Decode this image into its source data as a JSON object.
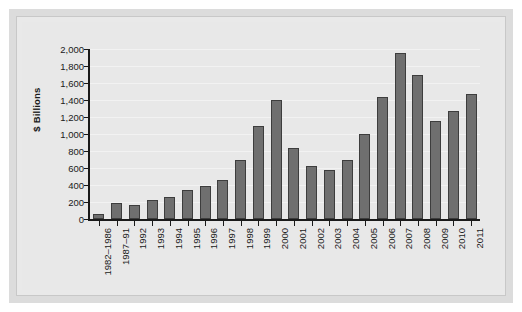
{
  "chart_data": {
    "type": "bar",
    "title": "",
    "subtitle": "",
    "xlabel": "",
    "ylabel": "$ Billions",
    "ylim": [
      0,
      2000
    ],
    "ytick_step": 200,
    "grid": true,
    "legend": null,
    "bar_color": "#6f6f6f",
    "bar_edge_color": "#3d3d3d",
    "plot_background": "#e8e8e8",
    "categories": [
      "1982–1986",
      "1987–91",
      "1992",
      "1993",
      "1994",
      "1995",
      "1996",
      "1997",
      "1998",
      "1999",
      "2000",
      "2001",
      "2002",
      "2003",
      "2004",
      "2005",
      "2006",
      "2007",
      "2008",
      "2009",
      "2010",
      "2011"
    ],
    "values": [
      60,
      190,
      165,
      220,
      255,
      340,
      390,
      460,
      690,
      1090,
      1400,
      840,
      620,
      580,
      700,
      1000,
      1440,
      1950,
      1700,
      1150,
      1270,
      1470
    ],
    "ytick_labels": [
      "0",
      "200",
      "400",
      "600",
      "800",
      "1,000",
      "1,200",
      "1,400",
      "1,600",
      "1,800",
      "2,000"
    ],
    "ytick_values": [
      0,
      200,
      400,
      600,
      800,
      1000,
      1200,
      1400,
      1600,
      1800,
      2000
    ]
  }
}
